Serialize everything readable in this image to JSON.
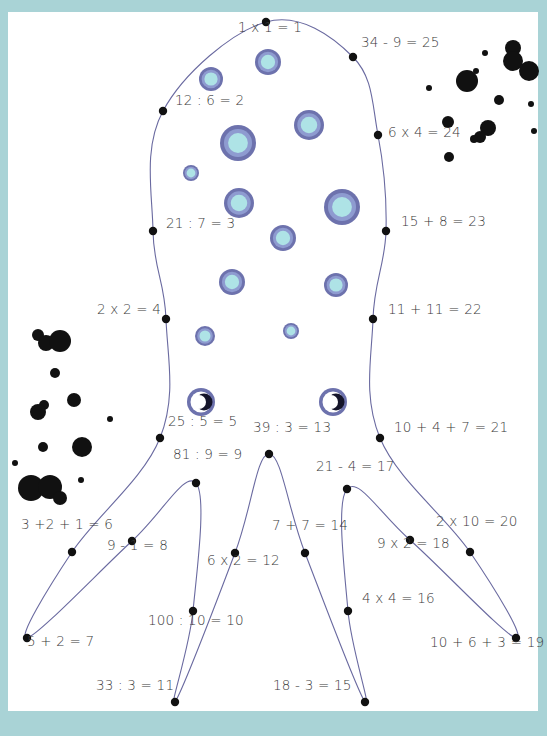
{
  "worksheet": {
    "theme": "connect-the-dots octopus",
    "colors": {
      "border": "#a9d3d6",
      "paper": "#ffffff",
      "outline": "#6a6aa0",
      "dot": "#111111",
      "spot_outer": "#6d72ad",
      "spot_mid": "#8e9bd0",
      "spot_inner": "#aee3e6",
      "ink": "#111111",
      "text": "#3a3a3a"
    },
    "dots": [
      {
        "n": 1,
        "label": "1 x 1 = 1",
        "x": 266,
        "y": 22,
        "lx": 238,
        "ly": 30
      },
      {
        "n": 2,
        "label": "12 : 6 = 2",
        "x": 163,
        "y": 111,
        "lx": 175,
        "ly": 103
      },
      {
        "n": 3,
        "label": "21 : 7 = 3",
        "x": 153,
        "y": 231,
        "lx": 166,
        "ly": 226
      },
      {
        "n": 4,
        "label": "2 x 2 = 4",
        "x": 166,
        "y": 319,
        "lx": 97,
        "ly": 312
      },
      {
        "n": 5,
        "label": "25 : 5 = 5",
        "x": 160,
        "y": 438,
        "lx": 168,
        "ly": 424
      },
      {
        "n": 6,
        "label": "3 +2 + 1 = 6",
        "x": 72,
        "y": 552,
        "lx": 21,
        "ly": 527
      },
      {
        "n": 7,
        "label": "5 + 2 = 7",
        "x": 27,
        "y": 638,
        "lx": 27,
        "ly": 644
      },
      {
        "n": 8,
        "label": "9 - 1 = 8",
        "x": 132,
        "y": 541,
        "lx": 107,
        "ly": 548
      },
      {
        "n": 9,
        "label": "81 : 9 = 9",
        "x": 196,
        "y": 483,
        "lx": 173,
        "ly": 457
      },
      {
        "n": 10,
        "label": "100 : 10 = 10",
        "x": 193,
        "y": 611,
        "lx": 148,
        "ly": 623
      },
      {
        "n": 11,
        "label": "33 : 3 = 11",
        "x": 175,
        "y": 702,
        "lx": 96,
        "ly": 688
      },
      {
        "n": 12,
        "label": "6 x 2 = 12",
        "x": 235,
        "y": 553,
        "lx": 207,
        "ly": 563
      },
      {
        "n": 13,
        "label": "39 : 3 = 13",
        "x": 269,
        "y": 454,
        "lx": 253,
        "ly": 430
      },
      {
        "n": 14,
        "label": "7 + 7 = 14",
        "x": 305,
        "y": 553,
        "lx": 272,
        "ly": 528
      },
      {
        "n": 15,
        "label": "18 - 3 = 15",
        "x": 365,
        "y": 702,
        "lx": 273,
        "ly": 688
      },
      {
        "n": 16,
        "label": "4 x 4 = 16",
        "x": 348,
        "y": 611,
        "lx": 362,
        "ly": 601
      },
      {
        "n": 17,
        "label": "21 - 4 = 17",
        "x": 347,
        "y": 489,
        "lx": 316,
        "ly": 469
      },
      {
        "n": 18,
        "label": "9 x 2 = 18",
        "x": 410,
        "y": 540,
        "lx": 377,
        "ly": 546
      },
      {
        "n": 19,
        "label": "10 + 6 + 3 = 19",
        "x": 516,
        "y": 638,
        "lx": 430,
        "ly": 645
      },
      {
        "n": 20,
        "label": "2 x 10 = 20",
        "x": 470,
        "y": 552,
        "lx": 436,
        "ly": 524
      },
      {
        "n": 21,
        "label": "10 + 4 + 7 = 21",
        "x": 380,
        "y": 438,
        "lx": 394,
        "ly": 430
      },
      {
        "n": 22,
        "label": "11 + 11 = 22",
        "x": 373,
        "y": 319,
        "lx": 388,
        "ly": 312
      },
      {
        "n": 23,
        "label": "15 + 8 = 23",
        "x": 386,
        "y": 231,
        "lx": 401,
        "ly": 224
      },
      {
        "n": 24,
        "label": "6 x 4 = 24",
        "x": 378,
        "y": 135,
        "lx": 388,
        "ly": 135
      },
      {
        "n": 25,
        "label": "34 - 9 = 25",
        "x": 353,
        "y": 57,
        "lx": 361,
        "ly": 45
      }
    ],
    "spots": [
      {
        "x": 211,
        "y": 79,
        "r": 12
      },
      {
        "x": 268,
        "y": 62,
        "r": 13
      },
      {
        "x": 238,
        "y": 143,
        "r": 18
      },
      {
        "x": 309,
        "y": 125,
        "r": 15
      },
      {
        "x": 191,
        "y": 173,
        "r": 8
      },
      {
        "x": 239,
        "y": 203,
        "r": 15
      },
      {
        "x": 342,
        "y": 207,
        "r": 18
      },
      {
        "x": 283,
        "y": 238,
        "r": 13
      },
      {
        "x": 232,
        "y": 282,
        "r": 13
      },
      {
        "x": 336,
        "y": 285,
        "r": 12
      },
      {
        "x": 205,
        "y": 336,
        "r": 10
      },
      {
        "x": 291,
        "y": 331,
        "r": 8
      }
    ],
    "eyes": [
      {
        "x": 201,
        "y": 402
      },
      {
        "x": 333,
        "y": 402
      }
    ],
    "ink_blots": [
      {
        "x": 38,
        "y": 335,
        "r": 6
      },
      {
        "x": 46,
        "y": 343,
        "r": 8
      },
      {
        "x": 60,
        "y": 341,
        "r": 11
      },
      {
        "x": 55,
        "y": 373,
        "r": 5
      },
      {
        "x": 44,
        "y": 405,
        "r": 5
      },
      {
        "x": 38,
        "y": 412,
        "r": 8
      },
      {
        "x": 74,
        "y": 400,
        "r": 7
      },
      {
        "x": 82,
        "y": 447,
        "r": 10
      },
      {
        "x": 43,
        "y": 447,
        "r": 5
      },
      {
        "x": 110,
        "y": 419,
        "r": 3
      },
      {
        "x": 15,
        "y": 463,
        "r": 3
      },
      {
        "x": 81,
        "y": 480,
        "r": 3
      },
      {
        "x": 31,
        "y": 488,
        "r": 13
      },
      {
        "x": 50,
        "y": 487,
        "r": 12
      },
      {
        "x": 60,
        "y": 498,
        "r": 7
      },
      {
        "x": 513,
        "y": 48,
        "r": 8
      },
      {
        "x": 513,
        "y": 61,
        "r": 10
      },
      {
        "x": 529,
        "y": 71,
        "r": 10
      },
      {
        "x": 485,
        "y": 53,
        "r": 3
      },
      {
        "x": 467,
        "y": 81,
        "r": 11
      },
      {
        "x": 476,
        "y": 71,
        "r": 3
      },
      {
        "x": 429,
        "y": 88,
        "r": 3
      },
      {
        "x": 499,
        "y": 100,
        "r": 5
      },
      {
        "x": 531,
        "y": 104,
        "r": 3
      },
      {
        "x": 448,
        "y": 122,
        "r": 6
      },
      {
        "x": 488,
        "y": 128,
        "r": 8
      },
      {
        "x": 480,
        "y": 137,
        "r": 6
      },
      {
        "x": 474,
        "y": 139,
        "r": 4
      },
      {
        "x": 534,
        "y": 131,
        "r": 3
      },
      {
        "x": 449,
        "y": 157,
        "r": 5
      }
    ]
  }
}
